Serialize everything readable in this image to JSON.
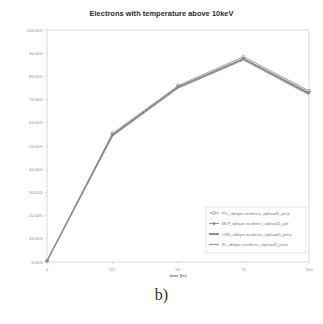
{
  "figure": {
    "caption": "b)",
    "title": "Electrons with temperature above 10keV"
  },
  "chart_data": {
    "type": "line",
    "title": "Electrons with temperature above 10keV",
    "xlabel": "time (fs)",
    "ylabel": "",
    "x": [
      0,
      25,
      50,
      75,
      100
    ],
    "xlim": [
      0,
      100
    ],
    "ylim": [
      0,
      100
    ],
    "xticks": [
      0,
      25,
      50,
      75,
      100
    ],
    "xtick_labels": [
      "0",
      "25",
      "50",
      "75",
      "100"
    ],
    "yticks": [
      0,
      10,
      20,
      30,
      40,
      50,
      60,
      70,
      80,
      90,
      100
    ],
    "ytick_labels": [
      "0.00%",
      "10.00%",
      "20.00%",
      "30.00%",
      "40.00%",
      "50.00%",
      "60.00%",
      "70.00%",
      "80.00%",
      "90.00%",
      "100.00%"
    ],
    "grid": false,
    "legend_position": "lower right",
    "series": [
      {
        "name": "PIC_oblique incidence_alpha=45_pol:p",
        "values": [
          0.5,
          55.5,
          76.0,
          88.5,
          73.8
        ],
        "color": "#9a9a9a",
        "marker": "circle-open",
        "linewidth": 0.9
      },
      {
        "name": "MLP_oblique incidence_alpha=45_pol:",
        "values": [
          0.5,
          55.0,
          75.6,
          87.8,
          73.2
        ],
        "color": "#8c8c8c",
        "marker": "diamond",
        "linewidth": 0.9
      },
      {
        "name": "CNN_oblique incidence_alpha=45_pol:p",
        "values": [
          0.5,
          54.6,
          75.2,
          87.4,
          72.6
        ],
        "color": "#7a7a7a",
        "marker": "none",
        "linewidth": 1.3
      },
      {
        "name": "FL_oblique incidence_alpha=45_pol:p",
        "values": [
          0.5,
          54.2,
          74.9,
          87.0,
          72.0
        ],
        "color": "#9e9e9e",
        "marker": "none",
        "linewidth": 0.9
      }
    ]
  }
}
